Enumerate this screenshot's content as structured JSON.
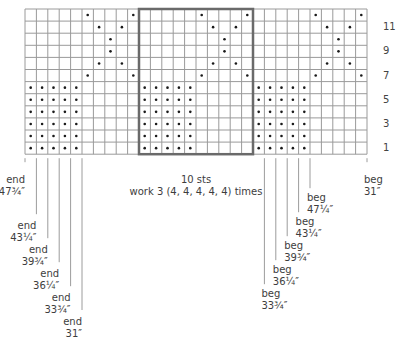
{
  "chart_data": {
    "type": "knitting-chart",
    "columns": 30,
    "rows": 12,
    "repeat": {
      "start_col": 11,
      "end_col": 20,
      "label": "10 sts",
      "instruction": "work 3 (4, 4, 4, 4, 4) times"
    },
    "row_numbers": [
      1,
      3,
      5,
      7,
      9,
      11
    ],
    "dots": {
      "1": [
        1,
        2,
        3,
        4,
        5,
        11,
        12,
        13,
        14,
        15,
        21,
        22,
        23,
        24,
        25
      ],
      "2": [
        1,
        2,
        3,
        4,
        5,
        11,
        12,
        13,
        14,
        15,
        21,
        22,
        23,
        24,
        25
      ],
      "3": [
        1,
        2,
        3,
        4,
        5,
        11,
        12,
        13,
        14,
        15,
        21,
        22,
        23,
        24,
        25
      ],
      "4": [
        1,
        2,
        3,
        4,
        5,
        11,
        12,
        13,
        14,
        15,
        21,
        22,
        23,
        24,
        25
      ],
      "5": [
        1,
        2,
        3,
        4,
        5,
        11,
        12,
        13,
        14,
        15,
        21,
        22,
        23,
        24,
        25
      ],
      "6": [
        1,
        2,
        3,
        4,
        5,
        11,
        12,
        13,
        14,
        15,
        21,
        22,
        23,
        24,
        25
      ],
      "7": [
        6,
        10,
        16,
        20,
        26,
        30
      ],
      "8": [
        7,
        9,
        17,
        19,
        27,
        29
      ],
      "9": [
        8,
        18,
        28
      ],
      "10": [
        8,
        18,
        28
      ],
      "11": [
        7,
        9,
        17,
        19,
        27,
        29
      ],
      "12": [
        6,
        10,
        16,
        20,
        26,
        30
      ]
    },
    "end_markers": [
      {
        "label": "end",
        "size": "47¾″",
        "col_line": 0
      },
      {
        "label": "end",
        "size": "43¼″",
        "col_line": 1
      },
      {
        "label": "end",
        "size": "39¾″",
        "col_line": 2
      },
      {
        "label": "end",
        "size": "36¼″",
        "col_line": 3
      },
      {
        "label": "end",
        "size": "33¾″",
        "col_line": 4
      },
      {
        "label": "end",
        "size": "31″",
        "col_line": 5
      }
    ],
    "beg_markers": [
      {
        "label": "beg",
        "size": "47¼″",
        "col_line": 25
      },
      {
        "label": "beg",
        "size": "43¼″",
        "col_line": 24
      },
      {
        "label": "beg",
        "size": "39¾″",
        "col_line": 23
      },
      {
        "label": "beg",
        "size": "36¼″",
        "col_line": 22
      },
      {
        "label": "beg",
        "size": "33¾″",
        "col_line": 21
      },
      {
        "label": "beg",
        "size": "31″",
        "col_line": 30
      }
    ]
  },
  "colors": {
    "grid": "#9a9a9a",
    "repeat_box": "#6a6a6a",
    "dot": "#1a1a1a",
    "marker_line": "#9c9c9c",
    "text": "#3d3d3d"
  }
}
